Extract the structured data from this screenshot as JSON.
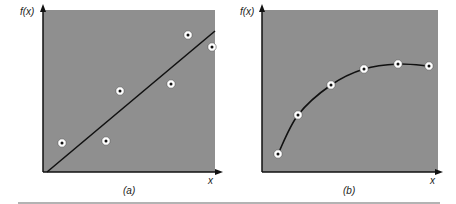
{
  "figure": {
    "panels": [
      {
        "id": "a",
        "caption": "(a)",
        "ylabel": "f(x)",
        "xlabel": "x",
        "fit": "straight line (linear regression)",
        "points_px": [
          [
            62,
            143
          ],
          [
            106,
            141
          ],
          [
            120,
            91
          ],
          [
            171,
            84
          ],
          [
            188,
            35
          ],
          [
            212,
            47
          ]
        ],
        "line_px": [
          [
            47,
            172
          ],
          [
            215,
            31
          ]
        ]
      },
      {
        "id": "b",
        "caption": "(b)",
        "ylabel": "f(x)",
        "xlabel": "x",
        "fit": "smooth curve (interpolation)",
        "points_px": [
          [
            278,
            154
          ],
          [
            298,
            115
          ],
          [
            331,
            85
          ],
          [
            364,
            69
          ],
          [
            398,
            64
          ],
          [
            429,
            66
          ]
        ]
      }
    ],
    "colors": {
      "panel_fill": "#8f8f8f",
      "axis": "#111111",
      "curve": "#111111",
      "marker_ring": "#ffffff",
      "marker_dot": "#111111",
      "rule": "#9a9a9a"
    }
  },
  "chart_data": [
    {
      "type": "scatter",
      "title": "(a)",
      "xlabel": "x",
      "ylabel": "f(x)",
      "grid": false,
      "series": [
        {
          "name": "data points",
          "x": [
            1,
            3.6,
            4.4,
            7.3,
            8.3,
            9.7
          ],
          "y": [
            1.8,
            1.9,
            5.0,
            5.4,
            8.4,
            7.7
          ]
        },
        {
          "name": "least-squares line",
          "type": "line",
          "x": [
            0.2,
            10
          ],
          "y": [
            0,
            8.7
          ]
        }
      ],
      "xlim": [
        0,
        10
      ],
      "ylim": [
        0,
        10
      ]
    },
    {
      "type": "line",
      "title": "(b)",
      "xlabel": "x",
      "ylabel": "f(x)",
      "grid": false,
      "series": [
        {
          "name": "data points (interpolated curve)",
          "x": [
            0.9,
            2.0,
            3.9,
            5.8,
            7.7,
            9.5
          ],
          "y": [
            1.1,
            3.5,
            5.3,
            6.3,
            6.6,
            6.5
          ]
        }
      ],
      "xlim": [
        0,
        10
      ],
      "ylim": [
        0,
        10
      ]
    }
  ]
}
